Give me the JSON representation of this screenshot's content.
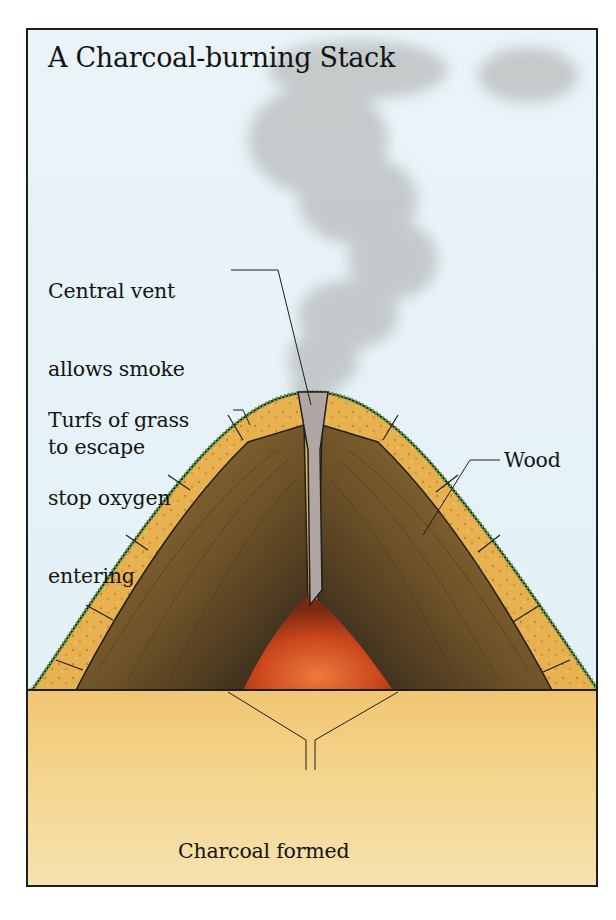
{
  "title": "A Charcoal-burning Stack",
  "labels": {
    "vent": {
      "line1": "Central vent",
      "line2": "allows smoke",
      "line3": "to escape"
    },
    "turfs": {
      "line1": "Turfs of grass",
      "line2": "stop oxygen",
      "line3": "entering"
    },
    "wood": "Wood",
    "charcoal": {
      "line1": "Charcoal formed",
      "line2": "by burning wood",
      "line3": "without much oxygen"
    }
  },
  "colors": {
    "sky": "#e6f2f7",
    "smoke": "#b9bcbd",
    "turf": "#e7b552",
    "grass": "#5d9a45",
    "wood": "#8a6a32",
    "charcoal": "#2a2520",
    "ember": "#c8451c",
    "vent": "#b0a7a4",
    "ground": "#f2cd7f",
    "frame": "#1e1e1e"
  }
}
